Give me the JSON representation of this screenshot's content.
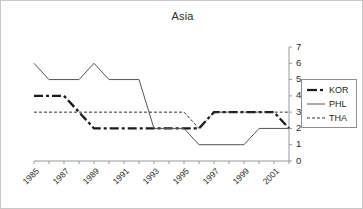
{
  "chart": {
    "title": "Asia",
    "y_axis_position": "right",
    "axis_color": "#9a9a9a",
    "border_color": "#c8c8c8"
  },
  "legend": {
    "position": "right",
    "entries": [
      {
        "label": "KOR",
        "style": "thick-dash-dot",
        "color": "#1a1a1a"
      },
      {
        "label": "PHL",
        "style": "thin-solid",
        "color": "#555555"
      },
      {
        "label": "THA",
        "style": "thin-dashed",
        "color": "#333333"
      }
    ]
  },
  "chart_data": {
    "type": "line",
    "title": "Asia",
    "xlabel": "",
    "ylabel": "",
    "ylim": [
      0,
      7
    ],
    "yticks": [
      0,
      1,
      2,
      3,
      4,
      5,
      6,
      7
    ],
    "grid": false,
    "legend_position": "right",
    "x": [
      1985,
      1986,
      1987,
      1988,
      1989,
      1990,
      1991,
      1992,
      1993,
      1994,
      1995,
      1996,
      1997,
      1998,
      1999,
      2000,
      2001,
      2002
    ],
    "xtick_labels": [
      "1985",
      "1987",
      "1989",
      "1991",
      "1993",
      "1995",
      "1997",
      "1999",
      "2001"
    ],
    "xtick_years": [
      1985,
      1987,
      1989,
      1991,
      1993,
      1995,
      1997,
      1999,
      2001
    ],
    "series": [
      {
        "name": "KOR",
        "values": [
          4,
          4,
          4,
          3,
          2,
          2,
          2,
          2,
          2,
          2,
          2,
          2,
          3,
          3,
          3,
          3,
          3,
          2
        ]
      },
      {
        "name": "PHL",
        "values": [
          6,
          5,
          5,
          5,
          6,
          5,
          5,
          5,
          2,
          2,
          2,
          1,
          1,
          1,
          1,
          2,
          2,
          2
        ]
      },
      {
        "name": "THA",
        "values": [
          3,
          3,
          3,
          3,
          3,
          3,
          3,
          3,
          3,
          3,
          3,
          2,
          3,
          3,
          3,
          3,
          3,
          3
        ]
      }
    ]
  }
}
